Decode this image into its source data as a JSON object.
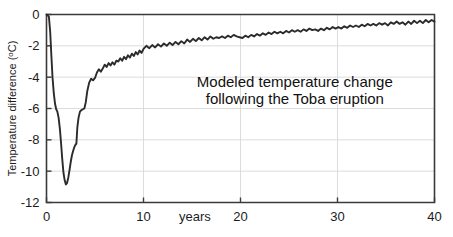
{
  "chart_data": {
    "type": "line",
    "title": "",
    "annotation_lines": [
      "Modeled temperature change",
      "following the Toba eruption"
    ],
    "xlabel": "years",
    "ylabel": "Temperature difference (ºC)",
    "ylabel_main": "Temperature difference (",
    "ylabel_unit_sup": "o",
    "ylabel_unit_rest": "C)",
    "xlim": [
      0,
      40
    ],
    "ylim": [
      -12,
      0
    ],
    "xticks": [
      0,
      10,
      20,
      30,
      40
    ],
    "xtick_labels": [
      "0",
      "10",
      "20",
      "30",
      "40"
    ],
    "yticks": [
      0,
      -2,
      -4,
      -6,
      -8,
      -10,
      -12
    ],
    "ytick_labels": [
      "0",
      "-2",
      "-4",
      "-6",
      "-8",
      "-10",
      "-12"
    ],
    "grid": "horizontal and vertical gridlines at major ticks",
    "legend": "none",
    "line_color": "#2b2b2b",
    "series": [
      {
        "name": "Modeled global temperature difference",
        "x": [
          0.0,
          0.12,
          0.25,
          0.38,
          0.5,
          0.62,
          0.75,
          0.88,
          1.0,
          1.12,
          1.25,
          1.38,
          1.5,
          1.62,
          1.75,
          1.88,
          2.0,
          2.12,
          2.25,
          2.38,
          2.5,
          2.62,
          2.75,
          2.88,
          3.0,
          3.08,
          3.18,
          3.3,
          3.45,
          3.6,
          3.75,
          3.9,
          4.05,
          4.2,
          4.4,
          4.6,
          4.8,
          5.0,
          5.2,
          5.4,
          5.6,
          5.8,
          6.0,
          6.2,
          6.4,
          6.6,
          6.8,
          7.0,
          7.2,
          7.4,
          7.6,
          7.8,
          8.0,
          8.2,
          8.4,
          8.6,
          8.8,
          9.0,
          9.2,
          9.4,
          9.6,
          9.8,
          10.0,
          10.3,
          10.6,
          10.9,
          11.2,
          11.5,
          11.8,
          12.1,
          12.4,
          12.7,
          13.0,
          13.3,
          13.6,
          13.9,
          14.2,
          14.5,
          14.8,
          15.1,
          15.4,
          15.7,
          16.0,
          16.3,
          16.6,
          16.9,
          17.2,
          17.5,
          17.8,
          18.1,
          18.4,
          18.7,
          19.0,
          19.3,
          19.6,
          19.9,
          20.2,
          20.5,
          20.8,
          21.1,
          21.4,
          21.7,
          22.0,
          22.3,
          22.6,
          22.9,
          23.2,
          23.5,
          23.8,
          24.1,
          24.4,
          24.7,
          25.0,
          25.3,
          25.6,
          25.9,
          26.2,
          26.5,
          26.8,
          27.1,
          27.4,
          27.7,
          28.0,
          28.3,
          28.6,
          28.9,
          29.2,
          29.5,
          29.8,
          30.1,
          30.4,
          30.7,
          31.0,
          31.3,
          31.6,
          31.9,
          32.2,
          32.5,
          32.8,
          33.1,
          33.4,
          33.7,
          34.0,
          34.3,
          34.6,
          34.9,
          35.2,
          35.5,
          35.8,
          36.1,
          36.4,
          36.7,
          37.0,
          37.3,
          37.6,
          37.9,
          38.2,
          38.5,
          38.8,
          39.1,
          39.4,
          39.7,
          40.0
        ],
        "y": [
          0.0,
          -0.05,
          -0.15,
          -1.1,
          -2.6,
          -4.0,
          -5.0,
          -5.7,
          -6.05,
          -6.2,
          -6.6,
          -7.3,
          -8.2,
          -9.2,
          -10.1,
          -10.6,
          -10.85,
          -10.75,
          -10.4,
          -9.9,
          -9.4,
          -9.0,
          -8.7,
          -8.45,
          -8.3,
          -8.25,
          -7.2,
          -6.6,
          -6.2,
          -6.1,
          -6.05,
          -6.0,
          -5.6,
          -4.9,
          -4.35,
          -4.1,
          -4.2,
          -4.05,
          -3.7,
          -3.5,
          -3.65,
          -3.45,
          -3.2,
          -3.35,
          -3.1,
          -3.25,
          -3.05,
          -3.2,
          -2.95,
          -3.0,
          -2.8,
          -2.95,
          -2.7,
          -2.85,
          -2.6,
          -2.75,
          -2.5,
          -2.65,
          -2.4,
          -2.55,
          -2.3,
          -2.45,
          -2.2,
          -2.0,
          -2.15,
          -1.95,
          -2.1,
          -1.9,
          -2.05,
          -1.85,
          -2.0,
          -1.8,
          -1.95,
          -1.75,
          -1.9,
          -1.7,
          -1.85,
          -1.6,
          -1.75,
          -1.55,
          -1.7,
          -1.5,
          -1.65,
          -1.45,
          -1.6,
          -1.4,
          -1.55,
          -1.45,
          -1.5,
          -1.4,
          -1.5,
          -1.35,
          -1.45,
          -1.3,
          -1.4,
          -1.45,
          -1.5,
          -1.35,
          -1.45,
          -1.3,
          -1.4,
          -1.25,
          -1.35,
          -1.2,
          -1.3,
          -1.15,
          -1.25,
          -1.1,
          -1.2,
          -1.1,
          -1.2,
          -1.05,
          -1.15,
          -1.0,
          -1.1,
          -1.0,
          -1.1,
          -0.95,
          -1.05,
          -0.9,
          -1.0,
          -0.95,
          -1.05,
          -0.9,
          -1.0,
          -0.85,
          -0.95,
          -0.8,
          -0.9,
          -0.8,
          -0.9,
          -0.75,
          -0.85,
          -0.7,
          -0.8,
          -0.7,
          -0.8,
          -0.65,
          -0.75,
          -0.6,
          -0.7,
          -0.6,
          -0.7,
          -0.55,
          -0.65,
          -0.55,
          -0.7,
          -0.5,
          -0.6,
          -0.45,
          -0.6,
          -0.5,
          -0.65,
          -0.45,
          -0.6,
          -0.4,
          -0.55,
          -0.4,
          -0.55,
          -0.35,
          -0.5,
          -0.35,
          -0.45
        ]
      }
    ]
  }
}
